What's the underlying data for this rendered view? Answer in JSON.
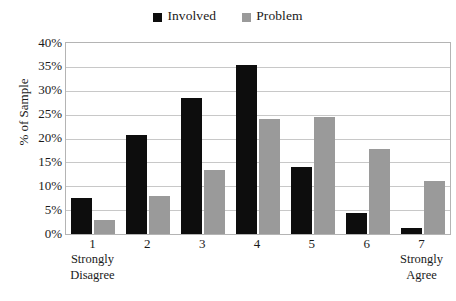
{
  "chart_data": {
    "type": "bar",
    "title": "",
    "xlabel": "",
    "ylabel": "% of Sample",
    "ylim": [
      0,
      40
    ],
    "ytick_labels": [
      "40%",
      "35%",
      "30%",
      "25%",
      "20%",
      "15%",
      "10%",
      "5%",
      "0%"
    ],
    "ytick_values": [
      40,
      35,
      30,
      25,
      20,
      15,
      10,
      5,
      0
    ],
    "grid": true,
    "legend_position": "top-center",
    "categories": [
      "1",
      "2",
      "3",
      "4",
      "5",
      "6",
      "7"
    ],
    "category_anchors": [
      "Strongly\nDisagree",
      "",
      "",
      "",
      "",
      "",
      "Strongly\nAgree"
    ],
    "anchor_low_line1": "Strongly",
    "anchor_low_line2": "Disagree",
    "anchor_high_line1": "Strongly",
    "anchor_high_line2": "Agree",
    "series": [
      {
        "name": "Involved",
        "color": "#0d0d0d",
        "values": [
          7.5,
          20.8,
          28.5,
          35.3,
          14.0,
          4.5,
          1.3
        ]
      },
      {
        "name": "Problem",
        "color": "#9a9a9a",
        "values": [
          3.0,
          8.0,
          13.5,
          24.0,
          24.6,
          17.8,
          11.0
        ]
      }
    ]
  },
  "legend": {
    "entries": [
      {
        "label": "Involved",
        "swatch": "black-square-swatch"
      },
      {
        "label": "Problem",
        "swatch": "gray-square-swatch"
      }
    ]
  },
  "axes": {
    "y_title": "% of Sample"
  }
}
